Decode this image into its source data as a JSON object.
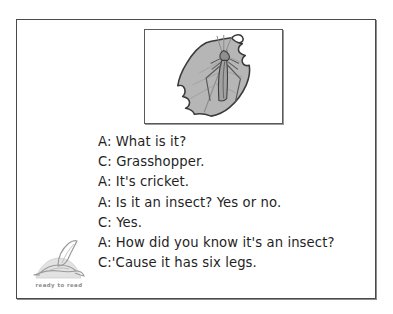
{
  "page": {
    "type": "worksheet-page",
    "background_color": "#ffffff",
    "frame_color": "#4a4a4a"
  },
  "illustration": {
    "caption_alt": "grasshopper resting on a leaf",
    "icon": "leaf-with-grasshopper-illustration",
    "leaf_fill": "#b6b6b6",
    "leaf_outline": "#3a3a3a",
    "insect_fill": "#9a9a9a",
    "insect_outline": "#444444",
    "border_color": "#5a5a5a"
  },
  "dialogue": {
    "lines": [
      {
        "speaker": "A",
        "text": "A: What is it?"
      },
      {
        "speaker": "C",
        "text": "C: Grasshopper."
      },
      {
        "speaker": "A",
        "text": "A: It's cricket."
      },
      {
        "speaker": "A",
        "text": "A: Is it an insect? Yes or no."
      },
      {
        "speaker": "C",
        "text": "C: Yes."
      },
      {
        "speaker": "A",
        "text": "A: How did you know it's an insect?"
      },
      {
        "speaker": "C",
        "text": "C:'Cause it has six legs."
      }
    ]
  },
  "logo": {
    "icon": "flying-bird-logo",
    "caption": "ready to read",
    "color": "#8c8c8c"
  }
}
